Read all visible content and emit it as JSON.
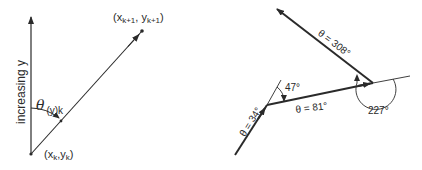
{
  "left_diagram": {
    "axis_label": "increasing y",
    "angle_symbol": "θ",
    "angle_subscript": "(y)k",
    "start_point": {
      "open": "(x",
      "sub1": "k",
      "mid": ",y",
      "sub2": "k",
      "close": ")"
    },
    "end_point": {
      "open": "(x",
      "sub1": "k+1",
      "mid": ", y",
      "sub2": "k+1",
      "close": ")"
    }
  },
  "right_diagram": {
    "segments": [
      {
        "label": "θ = 34°",
        "theta": 34
      },
      {
        "label": "θ = 81°",
        "theta": 81
      },
      {
        "label": "θ = 308°",
        "theta": 308
      }
    ],
    "turn_angles": [
      {
        "label": "47°",
        "value": 47
      },
      {
        "label": "227°",
        "value": 227
      }
    ]
  },
  "colors": {
    "ink": "#2a2a2a",
    "background": "#ffffff"
  }
}
